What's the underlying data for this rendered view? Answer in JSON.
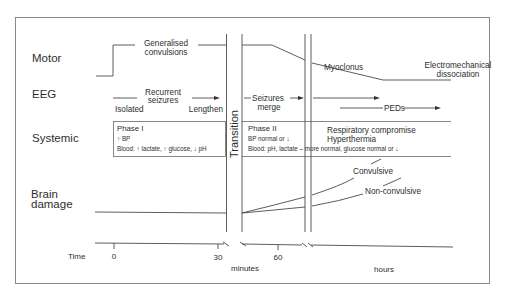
{
  "rows": {
    "motor": "Motor",
    "eeg": "EEG",
    "systemic": "Systemic",
    "brain_damage_line1": "Brain",
    "brain_damage_line2": "damage",
    "time": "Time"
  },
  "motor": {
    "generalised_line1": "Generalised",
    "generalised_line2": "convulsions",
    "myoclonus": "Myoclonus",
    "emd_line1": "Electromechanical",
    "emd_line2": "dissociation"
  },
  "eeg": {
    "recurrent_line1": "Recurrent",
    "recurrent_line2": "seizures",
    "isolated": "Isolated",
    "lengthen": "Lengthen",
    "merge_line1": "Seizures",
    "merge_line2": "merge",
    "peds": "PEDs"
  },
  "transition": "Transition",
  "systemic": {
    "phase1_title": "Phase I",
    "phase1_bp": "↑ BP",
    "phase1_blood": "Blood: ↑ lactate, ↑ glucose, ↓ pH",
    "phase2_title": "Phase II",
    "phase2_bp": "BP normal or ↓",
    "phase2_blood": "Blood: pH, lactate – more normal, glucose normal or ↓",
    "late_line1": "Respiratory compromise",
    "late_line2": "Hyperthermia"
  },
  "brain_damage": {
    "convulsive": "Convulsive",
    "non_convulsive": "Non-convulsive"
  },
  "time_axis": {
    "ticks": [
      "0",
      "30",
      "60"
    ],
    "unit_minutes": "minutes",
    "unit_hours": "hours"
  }
}
